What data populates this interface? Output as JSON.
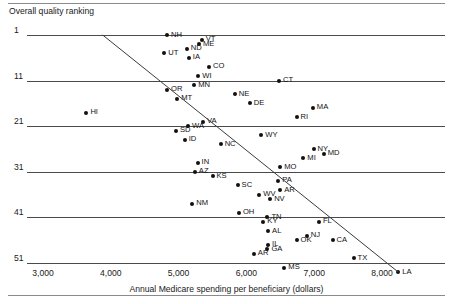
{
  "chart_data": {
    "type": "scatter",
    "title": "",
    "ylabel": "Overall quality ranking",
    "xlabel": "Annual Medicare spending per beneficiary (dollars)",
    "xlim": [
      2800,
      8600
    ],
    "ylim": [
      0,
      53
    ],
    "grid": "horizontal",
    "legend": "none",
    "y_inverted": true,
    "xticks": [
      {
        "value": 3000,
        "label": "3,000"
      },
      {
        "value": 4000,
        "label": "4,000"
      },
      {
        "value": 5000,
        "label": "5,000"
      },
      {
        "value": 6000,
        "label": "6,000"
      },
      {
        "value": 7000,
        "label": "7,000"
      },
      {
        "value": 8000,
        "label": "8,000"
      }
    ],
    "yticks": [
      {
        "value": 1,
        "label": "1"
      },
      {
        "value": 11,
        "label": "11"
      },
      {
        "value": 21,
        "label": "21"
      },
      {
        "value": 31,
        "label": "31"
      },
      {
        "value": 41,
        "label": "41"
      },
      {
        "value": 51,
        "label": "51"
      }
    ],
    "points": [
      {
        "label": "NH",
        "x": 4830,
        "y": 1,
        "lp": "right"
      },
      {
        "label": "VT",
        "x": 5340,
        "y": 2,
        "lp": "right"
      },
      {
        "label": "ME",
        "x": 5300,
        "y": 3,
        "lp": "right"
      },
      {
        "label": "ND",
        "x": 5120,
        "y": 4,
        "lp": "right"
      },
      {
        "label": "UT",
        "x": 4790,
        "y": 5,
        "lp": "right"
      },
      {
        "label": "IA",
        "x": 5150,
        "y": 6,
        "lp": "right"
      },
      {
        "label": "CO",
        "x": 5450,
        "y": 8,
        "lp": "right"
      },
      {
        "label": "WI",
        "x": 5290,
        "y": 10,
        "lp": "right"
      },
      {
        "label": "CT",
        "x": 6480,
        "y": 11,
        "lp": "right"
      },
      {
        "label": "MN",
        "x": 5230,
        "y": 12,
        "lp": "right"
      },
      {
        "label": "OR",
        "x": 4830,
        "y": 13,
        "lp": "right"
      },
      {
        "label": "NE",
        "x": 5830,
        "y": 14,
        "lp": "right"
      },
      {
        "label": "MT",
        "x": 4980,
        "y": 15,
        "lp": "right"
      },
      {
        "label": "DE",
        "x": 6050,
        "y": 16,
        "lp": "right"
      },
      {
        "label": "MA",
        "x": 6980,
        "y": 17,
        "lp": "right"
      },
      {
        "label": "HI",
        "x": 3640,
        "y": 18,
        "lp": "right"
      },
      {
        "label": "RI",
        "x": 6740,
        "y": 19,
        "lp": "right"
      },
      {
        "label": "VA",
        "x": 5360,
        "y": 20,
        "lp": "right"
      },
      {
        "label": "WA",
        "x": 5140,
        "y": 21,
        "lp": "right"
      },
      {
        "label": "SD",
        "x": 4960,
        "y": 22,
        "lp": "right"
      },
      {
        "label": "WY",
        "x": 6220,
        "y": 23,
        "lp": "right"
      },
      {
        "label": "ID",
        "x": 5090,
        "y": 24,
        "lp": "right"
      },
      {
        "label": "NC",
        "x": 5620,
        "y": 25,
        "lp": "right"
      },
      {
        "label": "NY",
        "x": 6990,
        "y": 26,
        "lp": "right"
      },
      {
        "label": "MD",
        "x": 7140,
        "y": 27,
        "lp": "right"
      },
      {
        "label": "MI",
        "x": 6840,
        "y": 28,
        "lp": "right"
      },
      {
        "label": "IN",
        "x": 5280,
        "y": 29,
        "lp": "right"
      },
      {
        "label": "MO",
        "x": 6500,
        "y": 30,
        "lp": "right"
      },
      {
        "label": "AZ",
        "x": 5240,
        "y": 31,
        "lp": "right"
      },
      {
        "label": "KS",
        "x": 5500,
        "y": 32,
        "lp": "right"
      },
      {
        "label": "PA",
        "x": 6470,
        "y": 33,
        "lp": "right"
      },
      {
        "label": "SC",
        "x": 5870,
        "y": 34,
        "lp": "right"
      },
      {
        "label": "AR",
        "x": 6500,
        "y": 35,
        "lp": "right"
      },
      {
        "label": "WV",
        "x": 6190,
        "y": 36,
        "lp": "right"
      },
      {
        "label": "NV",
        "x": 6350,
        "y": 37,
        "lp": "right"
      },
      {
        "label": "NM",
        "x": 5200,
        "y": 38,
        "lp": "right"
      },
      {
        "label": "OH",
        "x": 5890,
        "y": 40,
        "lp": "right"
      },
      {
        "label": "TN",
        "x": 6310,
        "y": 41,
        "lp": "right"
      },
      {
        "label": "KY",
        "x": 6250,
        "y": 42,
        "lp": "right"
      },
      {
        "label": "FL",
        "x": 7070,
        "y": 42,
        "lp": "right"
      },
      {
        "label": "AL",
        "x": 6320,
        "y": 44,
        "lp": "right"
      },
      {
        "label": "NJ",
        "x": 6890,
        "y": 45,
        "lp": "right"
      },
      {
        "label": "CA",
        "x": 7270,
        "y": 46,
        "lp": "right"
      },
      {
        "label": "OK",
        "x": 6740,
        "y": 46,
        "lp": "right"
      },
      {
        "label": "IL",
        "x": 6320,
        "y": 47,
        "lp": "right"
      },
      {
        "label": "GA",
        "x": 6310,
        "y": 48,
        "lp": "right"
      },
      {
        "label": "AR2",
        "x": 6110,
        "y": 49,
        "lp": "right",
        "display": "AR"
      },
      {
        "label": "TX",
        "x": 7580,
        "y": 50,
        "lp": "right"
      },
      {
        "label": "MS",
        "x": 6560,
        "y": 52,
        "lp": "right"
      },
      {
        "label": "LA",
        "x": 8240,
        "y": 53,
        "lp": "right"
      }
    ],
    "trendline": {
      "x_start": 3880,
      "y_start": 1,
      "x_end": 8240,
      "y_end": 53
    }
  }
}
